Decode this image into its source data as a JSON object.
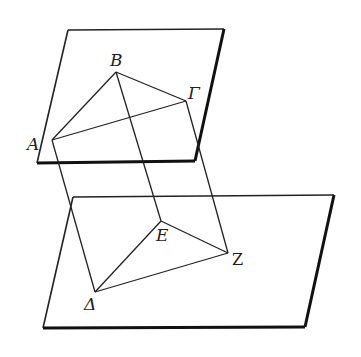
{
  "figure": {
    "stroke_color": "#222222",
    "background": "#ffffff"
  },
  "planes": {
    "upper": {
      "points": [
        [
          68,
          30
        ],
        [
          224,
          29
        ],
        [
          195,
          161
        ],
        [
          37,
          163
        ]
      ]
    },
    "lower": {
      "points": [
        [
          73,
          197
        ],
        [
          334,
          195
        ],
        [
          305,
          327
        ],
        [
          43,
          328
        ]
      ]
    }
  },
  "points": {
    "A": {
      "label": "A",
      "x": 52,
      "y": 140
    },
    "B": {
      "label": "B",
      "x": 116,
      "y": 72
    },
    "G": {
      "label": "Γ",
      "x": 186,
      "y": 101
    },
    "D": {
      "label": "Δ",
      "x": 95,
      "y": 292
    },
    "E": {
      "label": "E",
      "x": 161,
      "y": 221
    },
    "Z": {
      "label": "Z",
      "x": 228,
      "y": 253
    }
  },
  "labels": {
    "A": "A",
    "B": "B",
    "G": "Γ",
    "D": "Δ",
    "E": "E",
    "Z": "Z"
  }
}
